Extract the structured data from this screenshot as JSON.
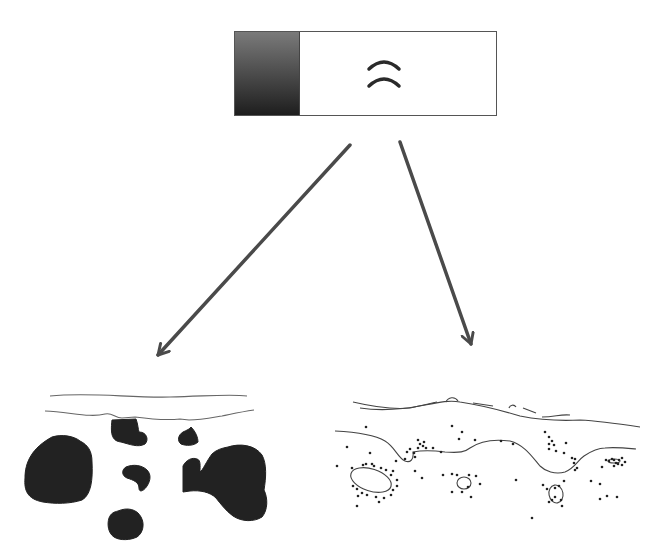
{
  "diagram": {
    "background": "#ffffff",
    "source_box": {
      "x": 234,
      "y": 31,
      "width": 263,
      "height": 85,
      "border_color": "#555555",
      "swatch": {
        "width": 64,
        "gradient_top": "#7a7a7a",
        "gradient_bottom": "#1e1e1e"
      },
      "symbol": {
        "name": "double-arc",
        "color": "#2a2a2a",
        "cx": 384,
        "arcs_y": [
          69,
          86
        ],
        "half_width": 15,
        "height": 7,
        "stroke": 3.5
      }
    },
    "arrows": [
      {
        "name": "left-arrow",
        "x1": 350,
        "y1": 145,
        "x2": 158,
        "y2": 355,
        "color": "#4a4a4a",
        "width": 3.5
      },
      {
        "name": "right-arrow",
        "x1": 400,
        "y1": 142,
        "x2": 471,
        "y2": 344,
        "color": "#4a4a4a",
        "width": 3.5
      }
    ],
    "left_pattern": {
      "name": "solid-blob-pattern",
      "fill": "#222222",
      "line_color": "#666666",
      "surface_lines": [
        "M50,396 C90,392 130,398 170,397 C210,396 230,394 247,396",
        "M45,411 C70,412 90,418 105,414 C112,412 115,418 122,418 L135,417 C150,419 170,420 180,419 L189,420 C200,420 210,418 222,416 C232,414 240,412 254,410"
      ],
      "blobs": [
        "M112,420 L136,419 C138,424 138,429 139,432 C147,432 149,440 145,444 C138,448 129,444 121,442 C113,441 110,436 112,420 Z",
        "M191,427 C196,432 198,438 198,442 C194,446 186,446 181,444 C177,441 178,435 183,432 C187,430 190,429 191,427 Z",
        "M52,437 C62,434 74,436 80,441 C88,445 92,451 92,462 C93,480 91,495 82,500 C70,504 55,504 43,502 C27,499 24,490 25,478 C25,462 32,448 52,437 Z",
        "M126,467 C133,464 142,465 147,470 C151,474 151,480 147,486 C144,491 139,493 139,488 C139,482 133,480 127,478 C122,476 121,470 126,467 Z",
        "M228,447 C240,443 255,445 262,455 C267,464 266,478 264,490 C268,498 268,510 262,517 C254,522 242,522 233,516 C226,511 220,503 216,498 C210,492 200,490 190,491 L183,492 L183,466 C186,460 192,457 197,459 C201,460 200,466 200,472 C203,470 206,462 212,454 C216,450 222,448 228,447 Z",
        "M118,511 C127,507 137,509 141,517 C145,524 143,533 137,537 C131,540 120,541 114,537 C108,533 107,524 109,518 C111,513 114,512 118,511 Z"
      ]
    },
    "right_pattern": {
      "name": "line-and-dot-pattern",
      "line_color": "#444444",
      "dot_color": "#222222",
      "lines": [
        "M353,402 C370,406 390,410 410,408 C420,406 428,404 437,402",
        "M360,408 C380,411 400,410 425,405 C440,402 450,400 460,402 C480,405 500,410 520,416 C540,420 560,421 580,420 C600,421 620,424 640,427",
        "M446,402 C448,397 455,396 458,401",
        "M473,403 L493,406",
        "M509,408 C510,405 514,404 516,407",
        "M523,408 L536,413",
        "M542,417 C555,417 560,414 570,415",
        "M335,431 C355,432 375,435 385,441 C395,447 398,458 405,461 C410,463 414,460 413,452 C418,451 430,450 445,452 C460,453 465,452 470,448 C480,441 495,439 510,441 C525,445 533,458 540,466 C545,471 555,475 565,472 C575,468 578,460 584,456 C590,452 598,448 605,448 C615,447 625,448 636,449"
      ],
      "ellipses": [
        {
          "cx": 371,
          "cy": 480,
          "rx": 21,
          "ry": 11,
          "rotate": 18
        },
        {
          "cx": 464,
          "cy": 483,
          "rx": 7,
          "ry": 6,
          "rotate": 0
        },
        {
          "cx": 556,
          "cy": 494,
          "rx": 7,
          "ry": 9,
          "rotate": -10
        },
        {
          "cx": 614,
          "cy": 461,
          "rx": 6,
          "ry": 2,
          "rotate": 0
        }
      ],
      "dots": [
        [
          366,
          427
        ],
        [
          347,
          447
        ],
        [
          370,
          453
        ],
        [
          337,
          466
        ],
        [
          452,
          426
        ],
        [
          462,
          432
        ],
        [
          459,
          439
        ],
        [
          475,
          440
        ],
        [
          501,
          441
        ],
        [
          513,
          444
        ],
        [
          545,
          432
        ],
        [
          566,
          443
        ],
        [
          418,
          440
        ],
        [
          420,
          444
        ],
        [
          424,
          442
        ],
        [
          418,
          448
        ],
        [
          426,
          448
        ],
        [
          433,
          448
        ],
        [
          423,
          446
        ],
        [
          410,
          449
        ],
        [
          407,
          452
        ],
        [
          441,
          452
        ],
        [
          396,
          461
        ],
        [
          405,
          459
        ],
        [
          414,
          453
        ],
        [
          415,
          457
        ],
        [
          352,
          468
        ],
        [
          363,
          465
        ],
        [
          366,
          464
        ],
        [
          372,
          464
        ],
        [
          374,
          466
        ],
        [
          381,
          468
        ],
        [
          386,
          470
        ],
        [
          393,
          471
        ],
        [
          391,
          475
        ],
        [
          397,
          480
        ],
        [
          397,
          486
        ],
        [
          393,
          490
        ],
        [
          391,
          495
        ],
        [
          384,
          498
        ],
        [
          376,
          497
        ],
        [
          367,
          495
        ],
        [
          362,
          493
        ],
        [
          357,
          489
        ],
        [
          353,
          486
        ],
        [
          358,
          496
        ],
        [
          415,
          471
        ],
        [
          422,
          478
        ],
        [
          443,
          475
        ],
        [
          452,
          474
        ],
        [
          457,
          475
        ],
        [
          469,
          475
        ],
        [
          476,
          476
        ],
        [
          468,
          487
        ],
        [
          462,
          492
        ],
        [
          452,
          492
        ],
        [
          471,
          497
        ],
        [
          357,
          506
        ],
        [
          379,
          502
        ],
        [
          480,
          484
        ],
        [
          516,
          480
        ],
        [
          549,
          437
        ],
        [
          552,
          441
        ],
        [
          549,
          444
        ],
        [
          554,
          445
        ],
        [
          549,
          449
        ],
        [
          556,
          451
        ],
        [
          564,
          453
        ],
        [
          572,
          458
        ],
        [
          575,
          459
        ],
        [
          574,
          463
        ],
        [
          577,
          468
        ],
        [
          575,
          470
        ],
        [
          564,
          481
        ],
        [
          559,
          486
        ],
        [
          555,
          488
        ],
        [
          543,
          485
        ],
        [
          555,
          497
        ],
        [
          552,
          500
        ],
        [
          549,
          502
        ],
        [
          561,
          500
        ],
        [
          547,
          489
        ],
        [
          562,
          506
        ],
        [
          532,
          518
        ],
        [
          591,
          481
        ],
        [
          600,
          484
        ],
        [
          606,
          460
        ],
        [
          609,
          461
        ],
        [
          612,
          459
        ],
        [
          614,
          460
        ],
        [
          619,
          460
        ],
        [
          622,
          458
        ],
        [
          625,
          462
        ],
        [
          622,
          465
        ],
        [
          618,
          464
        ],
        [
          614,
          466
        ],
        [
          616,
          463
        ],
        [
          602,
          467
        ],
        [
          607,
          496
        ],
        [
          600,
          499
        ],
        [
          617,
          497
        ]
      ]
    }
  }
}
